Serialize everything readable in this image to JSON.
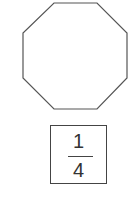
{
  "shape": {
    "type": "regular-octagon",
    "stroke": "#555555",
    "fill": "#ffffff",
    "points": "54,3 97,3 127,33 127,78 97,109 54,109 23,78 23,33"
  },
  "fraction": {
    "numerator": "1",
    "denominator": "4"
  }
}
